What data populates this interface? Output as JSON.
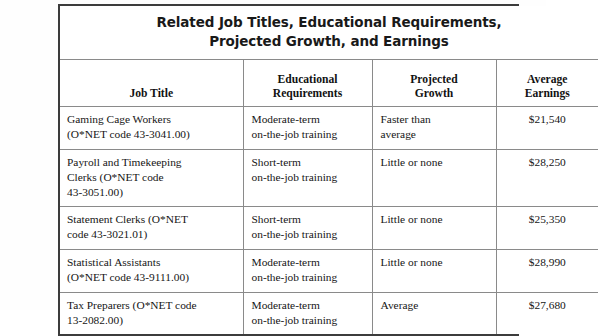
{
  "table": {
    "title_lines": [
      "Related Job Titles, Educational Requirements,",
      "Projected Growth, and Earnings"
    ],
    "headers": [
      {
        "lines": [
          "Job Title"
        ]
      },
      {
        "lines": [
          "Educational",
          "Requirements"
        ]
      },
      {
        "lines": [
          "Projected",
          "Growth"
        ]
      },
      {
        "lines": [
          "Average",
          "Earnings"
        ]
      }
    ],
    "rows": [
      {
        "job_title_lines": [
          "Gaming Cage Workers",
          "(O*NET code 43-3041.00)"
        ],
        "education_lines": [
          "Moderate-term",
          "on-the-job training"
        ],
        "growth_lines": [
          "Faster than",
          "average"
        ],
        "earnings": "$21,540"
      },
      {
        "job_title_lines": [
          "Payroll and Timekeeping",
          "Clerks (O*NET code",
          "43-3051.00)"
        ],
        "education_lines": [
          "Short-term",
          "on-the-job training"
        ],
        "growth_lines": [
          "Little or none"
        ],
        "earnings": "$28,250"
      },
      {
        "job_title_lines": [
          "Statement Clerks (O*NET",
          "code 43-3021.01)"
        ],
        "education_lines": [
          "Short-term",
          "on-the-job training"
        ],
        "growth_lines": [
          "Little or none"
        ],
        "earnings": "$25,350"
      },
      {
        "job_title_lines": [
          "Statistical Assistants",
          "(O*NET code 43-9111.00)"
        ],
        "education_lines": [
          "Moderate-term",
          "on-the-job training"
        ],
        "growth_lines": [
          "Little or none"
        ],
        "earnings": "$28,990"
      },
      {
        "job_title_lines": [
          "Tax Preparers (O*NET code",
          "13-2082.00)"
        ],
        "education_lines": [
          "Moderate-term",
          "on-the-job training"
        ],
        "growth_lines": [
          "Average"
        ],
        "earnings": "$27,680"
      }
    ]
  },
  "colors": {
    "page_background": "#fefefe",
    "table_background": "#ffffff",
    "outer_border": "#3c3c3c",
    "inner_border": "#8a8a8a",
    "title_text": "#191919",
    "body_text": "#161616"
  }
}
